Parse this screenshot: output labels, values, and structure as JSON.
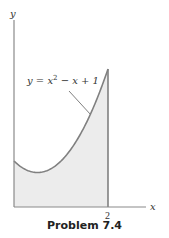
{
  "chart_data": {
    "type": "area",
    "title": "",
    "function": "y = x^2 - x + 1",
    "x": [
      0,
      0.25,
      0.5,
      0.75,
      1.0,
      1.25,
      1.5,
      1.75,
      2.0
    ],
    "series": [
      {
        "name": "y = x^2 - x + 1",
        "values": [
          1.0,
          0.8125,
          0.75,
          0.8125,
          1.0,
          1.3125,
          1.75,
          2.3125,
          3.0
        ]
      }
    ],
    "shaded_region": {
      "from_x": 0,
      "to_x": 2,
      "under": "y = x^2 - x + 1"
    },
    "xlabel": "x",
    "ylabel": "y",
    "x_ticks": [
      "2"
    ],
    "xlim": [
      0,
      2.4
    ],
    "ylim": [
      0,
      4
    ],
    "grid": false,
    "annotations": [
      {
        "text": "y = x² − x + 1",
        "points_to_x": 1.65
      }
    ],
    "colors": {
      "curve": "#808080",
      "fill": "#ececec",
      "axis": "#8a8a8a",
      "text": "#333333"
    }
  },
  "figure": {
    "y_label": "y",
    "x_label": "x",
    "tick_2": "2",
    "equation_prefix": "y = x",
    "equation_exp": "2",
    "equation_suffix": " − x + 1",
    "caption": "Problem 7.4"
  }
}
